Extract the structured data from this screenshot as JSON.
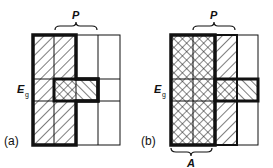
{
  "panels": [
    {
      "id": "a",
      "label": "(a)",
      "eg_label": "E",
      "eg_sub": "g",
      "brace_top": "P"
    },
    {
      "id": "b",
      "label": "(b)",
      "eg_label": "E",
      "eg_sub": "g",
      "brace_top": "P",
      "brace_bottom": "A"
    }
  ],
  "colors": {
    "ink": "#111111",
    "background": "#ffffff"
  }
}
